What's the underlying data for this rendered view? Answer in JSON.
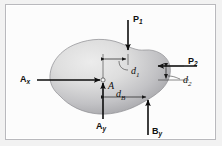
{
  "figure": {
    "type": "free-body-diagram",
    "caption": "",
    "panel": {
      "background_color": "#fcfcfc",
      "border_color": "#b9b9bd",
      "outer_background_color": "#f2f2f2"
    },
    "body": {
      "name": "rigid-body-blob",
      "fill_light": "#e3e3e3",
      "fill_dark": "#9e9ea2",
      "outline_color": "#8e8e92"
    }
  },
  "labels": {
    "force_p1": {
      "base": "P",
      "sub": "1"
    },
    "force_p2": {
      "base": "P",
      "sub": "2"
    },
    "reaction_ax": {
      "base": "A",
      "sub": "x"
    },
    "reaction_ay": {
      "base": "A",
      "sub": "y"
    },
    "reaction_by": {
      "base": "B",
      "sub": "y"
    },
    "point_a": "A",
    "dim_d1": {
      "base": "d",
      "sub": "1"
    },
    "dim_d2": {
      "base": "d",
      "sub": "2"
    },
    "dim_db": {
      "base": "d",
      "sub": "B"
    }
  },
  "forces": [
    {
      "id": "P1",
      "label": "P1",
      "direction": "down",
      "tail": {
        "x": 125,
        "y": 18
      },
      "head": {
        "x": 125,
        "y": 48
      },
      "label_pos": {
        "x": 129,
        "y": 14
      }
    },
    {
      "id": "P2",
      "label": "P2",
      "direction": "left",
      "tail": {
        "x": 196,
        "y": 64
      },
      "head": {
        "x": 155,
        "y": 64
      },
      "label_pos": {
        "x": 182,
        "y": 56
      }
    },
    {
      "id": "Ax",
      "label": "Ax",
      "direction": "right",
      "tail": {
        "x": 34,
        "y": 78
      },
      "head": {
        "x": 97,
        "y": 78
      },
      "label_pos": {
        "x": 18,
        "y": 73
      }
    },
    {
      "id": "Ay",
      "label": "Ay",
      "direction": "up",
      "tail": {
        "x": 100,
        "y": 117
      },
      "head": {
        "x": 100,
        "y": 80
      },
      "label_pos": {
        "x": 93,
        "y": 120
      }
    },
    {
      "id": "By",
      "label": "By",
      "direction": "up",
      "tail": {
        "x": 145,
        "y": 133
      },
      "head": {
        "x": 145,
        "y": 98
      },
      "label_pos": {
        "x": 148,
        "y": 127
      }
    }
  ],
  "dimensions": [
    {
      "id": "d1",
      "label": "d1",
      "orientation": "horizontal",
      "from": {
        "x": 100,
        "y": 58
      },
      "to": {
        "x": 125,
        "y": 58
      },
      "label_pos": {
        "x": 128,
        "y": 66
      }
    },
    {
      "id": "d2",
      "label": "d2",
      "orientation": "vertical",
      "from": {
        "x": 163,
        "y": 64
      },
      "to": {
        "x": 163,
        "y": 78
      },
      "label_pos": {
        "x": 181,
        "y": 74
      }
    },
    {
      "id": "dB",
      "label": "dB",
      "orientation": "horizontal",
      "from": {
        "x": 100,
        "y": 96
      },
      "to": {
        "x": 145,
        "y": 96
      },
      "label_pos": {
        "x": 112,
        "y": 90
      }
    }
  ],
  "points": [
    {
      "id": "A",
      "label": "A",
      "x": 100,
      "y": 78,
      "label_pos": {
        "x": 105,
        "y": 82
      }
    }
  ]
}
